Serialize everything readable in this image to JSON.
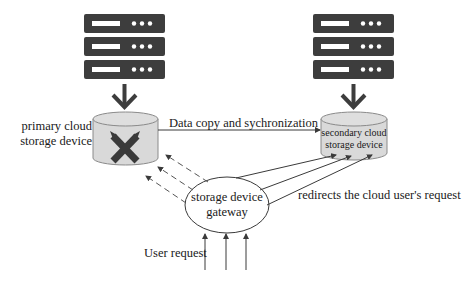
{
  "diagram": {
    "type": "storage-failover-diagram",
    "colors": {
      "server": "#3d3d3d",
      "server_slot": "#ffffff",
      "cylinder_fill": "#d9d9d9",
      "cylinder_stroke": "#8a8a8a",
      "failure_x": "#333333",
      "line": "#3a3a3a"
    },
    "nodes": {
      "primary_server": {
        "icon": "server-rack-icon"
      },
      "secondary_server": {
        "icon": "server-rack-icon"
      },
      "primary_storage": {
        "label_line1": "primary cloud",
        "label_line2": "storage device",
        "status": "failed",
        "status_icon": "failure-x-icon"
      },
      "secondary_storage": {
        "label_line1": "secondary cloud",
        "label_line2": "storage device"
      },
      "gateway": {
        "label_line1": "storage device",
        "label_line2": "gateway"
      }
    },
    "edges": {
      "sync": {
        "label": "Data copy and sychronization"
      },
      "redirect": {
        "label": "redirects the cloud user's request"
      },
      "user": {
        "label": "User request"
      }
    }
  }
}
